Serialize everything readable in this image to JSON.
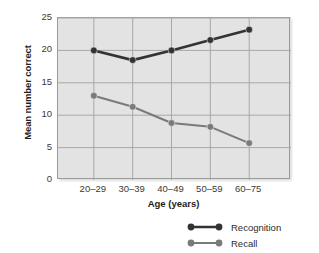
{
  "chart_data": {
    "type": "line",
    "title": "",
    "xlabel": "Age (years)",
    "ylabel": "Mean number correct",
    "categories": [
      "20–29",
      "30–39",
      "40–49",
      "50–59",
      "60–75"
    ],
    "yticks": [
      0,
      5,
      10,
      15,
      20,
      25
    ],
    "ylim": [
      0,
      25
    ],
    "grid": true,
    "legend_position": "bottom-right",
    "series": [
      {
        "name": "Recognition",
        "color": "#333333",
        "line_width": 2.6,
        "marker": "circle",
        "values": [
          20.0,
          18.5,
          20.0,
          21.6,
          23.2
        ]
      },
      {
        "name": "Recall",
        "color": "#7a7a7a",
        "line_width": 2.0,
        "marker": "circle",
        "values": [
          13.0,
          11.3,
          8.8,
          8.2,
          5.7
        ]
      }
    ]
  },
  "style": {
    "plot_background": "#e3e3e3",
    "grid_color": "#a8a8a8",
    "axis_color": "#8f8f8f",
    "page_background": "#ffffff",
    "text_color": "#2b2b2b"
  }
}
